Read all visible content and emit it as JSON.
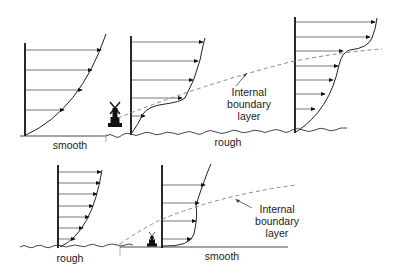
{
  "diagram": {
    "top_row": {
      "labels": {
        "left_surface": "smooth",
        "right_surface": "rough",
        "ibl_line1": "Internal",
        "ibl_line2": "boundary",
        "ibl_line3": "layer"
      }
    },
    "bottom_row": {
      "labels": {
        "left_surface": "rough",
        "right_surface": "smooth",
        "ibl_line1": "Internal",
        "ibl_line2": "boundary",
        "ibl_line3": "layer"
      }
    },
    "icons": [
      "windmill-icon",
      "windmill-icon"
    ],
    "colors": {
      "lines": "#222222",
      "dashed_boundary": "#888888",
      "background": "#ffffff"
    }
  }
}
